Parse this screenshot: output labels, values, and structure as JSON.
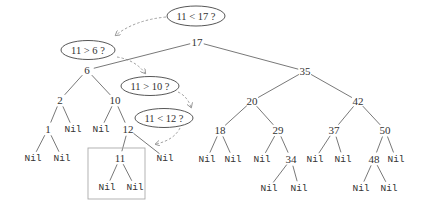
{
  "diagram": {
    "type": "binary-search-tree-insertion",
    "inserted_key": "11",
    "nodes": [
      {
        "id": "n17",
        "label": "17",
        "x": 197,
        "y": 42,
        "kind": "key"
      },
      {
        "id": "n6",
        "label": "6",
        "x": 87,
        "y": 70,
        "kind": "key"
      },
      {
        "id": "n35",
        "label": "35",
        "x": 305,
        "y": 71,
        "kind": "key"
      },
      {
        "id": "n2",
        "label": "2",
        "x": 60,
        "y": 100,
        "kind": "key"
      },
      {
        "id": "n10",
        "label": "10",
        "x": 115,
        "y": 100,
        "kind": "key"
      },
      {
        "id": "n20",
        "label": "20",
        "x": 252,
        "y": 101,
        "kind": "key"
      },
      {
        "id": "n42",
        "label": "42",
        "x": 358,
        "y": 101,
        "kind": "key"
      },
      {
        "id": "n1",
        "label": "1",
        "x": 48,
        "y": 129,
        "kind": "key"
      },
      {
        "id": "nil2r",
        "label": "Nil",
        "x": 73,
        "y": 129,
        "kind": "nil"
      },
      {
        "id": "nil10l",
        "label": "Nil",
        "x": 101,
        "y": 129,
        "kind": "nil"
      },
      {
        "id": "n12",
        "label": "12",
        "x": 128,
        "y": 129,
        "kind": "key"
      },
      {
        "id": "n18",
        "label": "18",
        "x": 220,
        "y": 130,
        "kind": "key"
      },
      {
        "id": "n29",
        "label": "29",
        "x": 278,
        "y": 130,
        "kind": "key"
      },
      {
        "id": "n37",
        "label": "37",
        "x": 334,
        "y": 130,
        "kind": "key"
      },
      {
        "id": "n50",
        "label": "50",
        "x": 385,
        "y": 130,
        "kind": "key"
      },
      {
        "id": "nil1l",
        "label": "Nil",
        "x": 33,
        "y": 158,
        "kind": "nil"
      },
      {
        "id": "nil1r",
        "label": "Nil",
        "x": 62,
        "y": 158,
        "kind": "nil"
      },
      {
        "id": "n11",
        "label": "11",
        "x": 120,
        "y": 158,
        "kind": "key"
      },
      {
        "id": "nil12r",
        "label": "Nil",
        "x": 165,
        "y": 158,
        "kind": "nil"
      },
      {
        "id": "nil18l",
        "label": "Nil",
        "x": 207,
        "y": 159,
        "kind": "nil"
      },
      {
        "id": "nil18r",
        "label": "Nil",
        "x": 233,
        "y": 159,
        "kind": "nil"
      },
      {
        "id": "nil29l",
        "label": "Nil",
        "x": 262,
        "y": 159,
        "kind": "nil"
      },
      {
        "id": "n34",
        "label": "34",
        "x": 291,
        "y": 159,
        "kind": "key"
      },
      {
        "id": "nil37l",
        "label": "Nil",
        "x": 315,
        "y": 159,
        "kind": "nil"
      },
      {
        "id": "nil37r",
        "label": "Nil",
        "x": 343,
        "y": 159,
        "kind": "nil"
      },
      {
        "id": "n48",
        "label": "48",
        "x": 374,
        "y": 159,
        "kind": "key"
      },
      {
        "id": "nil50r",
        "label": "Nil",
        "x": 396,
        "y": 159,
        "kind": "nil"
      },
      {
        "id": "nil11l",
        "label": "Nil",
        "x": 107,
        "y": 187,
        "kind": "nil"
      },
      {
        "id": "nil11r",
        "label": "Nil",
        "x": 135,
        "y": 187,
        "kind": "nil"
      },
      {
        "id": "nil34l",
        "label": "Nil",
        "x": 269,
        "y": 188,
        "kind": "nil"
      },
      {
        "id": "nil34r",
        "label": "Nil",
        "x": 299,
        "y": 188,
        "kind": "nil"
      },
      {
        "id": "nil48l",
        "label": "Nil",
        "x": 361,
        "y": 188,
        "kind": "nil"
      },
      {
        "id": "nil48r",
        "label": "Nil",
        "x": 389,
        "y": 188,
        "kind": "nil"
      }
    ],
    "edges": [
      [
        "n17",
        "n6"
      ],
      [
        "n17",
        "n35"
      ],
      [
        "n6",
        "n2"
      ],
      [
        "n6",
        "n10"
      ],
      [
        "n35",
        "n20"
      ],
      [
        "n35",
        "n42"
      ],
      [
        "n2",
        "n1"
      ],
      [
        "n2",
        "nil2r"
      ],
      [
        "n10",
        "nil10l"
      ],
      [
        "n10",
        "n12"
      ],
      [
        "n20",
        "n18"
      ],
      [
        "n20",
        "n29"
      ],
      [
        "n42",
        "n37"
      ],
      [
        "n42",
        "n50"
      ],
      [
        "n1",
        "nil1l"
      ],
      [
        "n1",
        "nil1r"
      ],
      [
        "n12",
        "n11"
      ],
      [
        "n12",
        "nil12r"
      ],
      [
        "n18",
        "nil18l"
      ],
      [
        "n18",
        "nil18r"
      ],
      [
        "n29",
        "nil29l"
      ],
      [
        "n29",
        "n34"
      ],
      [
        "n37",
        "nil37l"
      ],
      [
        "n37",
        "nil37r"
      ],
      [
        "n50",
        "n48"
      ],
      [
        "n50",
        "nil50r"
      ],
      [
        "n11",
        "nil11l"
      ],
      [
        "n11",
        "nil11r"
      ],
      [
        "n34",
        "nil34l"
      ],
      [
        "n34",
        "nil34r"
      ],
      [
        "n48",
        "nil48l"
      ],
      [
        "n48",
        "nil48r"
      ]
    ],
    "comparisons": [
      {
        "label": "11 < 17 ?",
        "cx": 196,
        "cy": 16,
        "rx": 29,
        "ry": 10
      },
      {
        "label": "11 > 6 ?",
        "cx": 88,
        "cy": 50,
        "rx": 27,
        "ry": 9.5
      },
      {
        "label": "11 > 10 ?",
        "cx": 150,
        "cy": 86,
        "rx": 29,
        "ry": 9.5
      },
      {
        "label": "11 < 12 ?",
        "cx": 164,
        "cy": 118,
        "rx": 29,
        "ry": 9.5
      }
    ],
    "search_path_arrows": [
      {
        "d": "M166,17 Q135,20 116,35"
      },
      {
        "d": "M117,57 Q135,60 145,73"
      },
      {
        "d": "M178,92 Q187,96 191,107"
      },
      {
        "d": "M180,128 Q174,140 156,144"
      }
    ],
    "inserted_highlight_box": {
      "x": 88,
      "y": 148,
      "w": 57,
      "h": 51
    }
  }
}
